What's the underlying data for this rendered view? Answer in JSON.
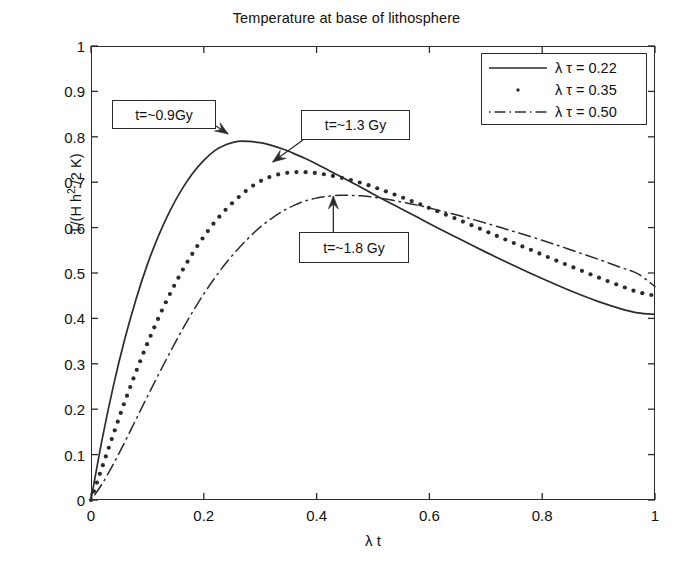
{
  "chart_data": {
    "type": "line",
    "title": "Temperature at base of lithosphere",
    "xlabel": "λ t",
    "ylabel": "T/(H h2 /2 K)",
    "xlim": [
      0,
      1
    ],
    "ylim": [
      0,
      1
    ],
    "grid": false,
    "legend_position": "upper right",
    "xticks": [
      "0",
      "0.2",
      "0.4",
      "0.6",
      "0.8",
      "1"
    ],
    "xtick_values": [
      0,
      0.2,
      0.4,
      0.6,
      0.8,
      1
    ],
    "yticks": [
      "0",
      "0.1",
      "0.2",
      "0.3",
      "0.4",
      "0.5",
      "0.6",
      "0.7",
      "0.8",
      "0.9",
      "1"
    ],
    "ytick_values": [
      0,
      0.1,
      0.2,
      0.3,
      0.4,
      0.5,
      0.6,
      0.7,
      0.8,
      0.9,
      1
    ],
    "x": [
      0,
      0.02,
      0.04,
      0.06,
      0.08,
      0.1,
      0.12,
      0.14,
      0.16,
      0.18,
      0.2,
      0.22,
      0.24,
      0.26,
      0.28,
      0.3,
      0.32,
      0.34,
      0.36,
      0.38,
      0.4,
      0.42,
      0.44,
      0.46,
      0.48,
      0.5,
      0.54,
      0.58,
      0.62,
      0.66,
      0.7,
      0.74,
      0.78,
      0.82,
      0.86,
      0.9,
      0.94,
      0.97,
      1.0
    ],
    "series": [
      {
        "name": "λ τ = 0.22",
        "style": "solid",
        "peak_x": 0.26,
        "peak_y": 0.79,
        "end_y": 0.41,
        "values": [
          0.0,
          0.135,
          0.253,
          0.355,
          0.443,
          0.519,
          0.583,
          0.637,
          0.682,
          0.719,
          0.748,
          0.77,
          0.783,
          0.79,
          0.79,
          0.787,
          0.781,
          0.773,
          0.763,
          0.752,
          0.74,
          0.727,
          0.714,
          0.701,
          0.688,
          0.674,
          0.648,
          0.622,
          0.596,
          0.571,
          0.546,
          0.522,
          0.499,
          0.477,
          0.456,
          0.437,
          0.421,
          0.412,
          0.409
        ]
      },
      {
        "name": "λ τ = 0.35",
        "style": "dotted",
        "peak_x": 0.33,
        "peak_y": 0.72,
        "end_y": 0.45,
        "values": [
          0.0,
          0.073,
          0.146,
          0.217,
          0.283,
          0.345,
          0.402,
          0.454,
          0.501,
          0.543,
          0.58,
          0.613,
          0.641,
          0.665,
          0.686,
          0.702,
          0.713,
          0.719,
          0.722,
          0.722,
          0.72,
          0.716,
          0.711,
          0.705,
          0.698,
          0.69,
          0.672,
          0.653,
          0.633,
          0.613,
          0.592,
          0.571,
          0.551,
          0.53,
          0.51,
          0.49,
          0.471,
          0.458,
          0.45
        ]
      },
      {
        "name": "λ τ = 0.50",
        "style": "dashdot",
        "peak_x": 0.44,
        "peak_y": 0.67,
        "end_y": 0.47,
        "values": [
          0.0,
          0.036,
          0.08,
          0.128,
          0.178,
          0.228,
          0.277,
          0.325,
          0.371,
          0.414,
          0.454,
          0.49,
          0.523,
          0.552,
          0.578,
          0.601,
          0.62,
          0.636,
          0.649,
          0.659,
          0.665,
          0.669,
          0.671,
          0.671,
          0.67,
          0.667,
          0.659,
          0.649,
          0.637,
          0.624,
          0.61,
          0.595,
          0.58,
          0.564,
          0.547,
          0.53,
          0.512,
          0.498,
          0.47
        ]
      }
    ],
    "annotations": [
      {
        "label": "t=~0.9Gy",
        "target_x": 0.245,
        "target_y": 0.793
      },
      {
        "label": "t=~1.3 Gy",
        "target_x": 0.315,
        "target_y": 0.729
      },
      {
        "label": "t=~1.8 Gy",
        "target_x": 0.435,
        "target_y": 0.683
      }
    ]
  }
}
